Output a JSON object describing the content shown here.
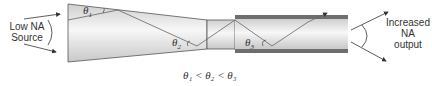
{
  "diagram": {
    "left_label": {
      "line1": "Low NA",
      "line2": "Source"
    },
    "right_label": {
      "line1": "Increased",
      "line2": "NA",
      "line3": "output"
    },
    "angles": {
      "theta1": "θ",
      "theta1_sub": "1",
      "theta2": "θ",
      "theta2_sub": "2",
      "theta3": "θ",
      "theta3_sub": "3"
    },
    "equation": "θ₁ < θ₂ < θ₃",
    "colors": {
      "core_light": "#f2f2f2",
      "core_mid": "#d0d0d0",
      "cladding": "#6e6e6e",
      "outline": "#555555",
      "ray": "#666666"
    }
  }
}
